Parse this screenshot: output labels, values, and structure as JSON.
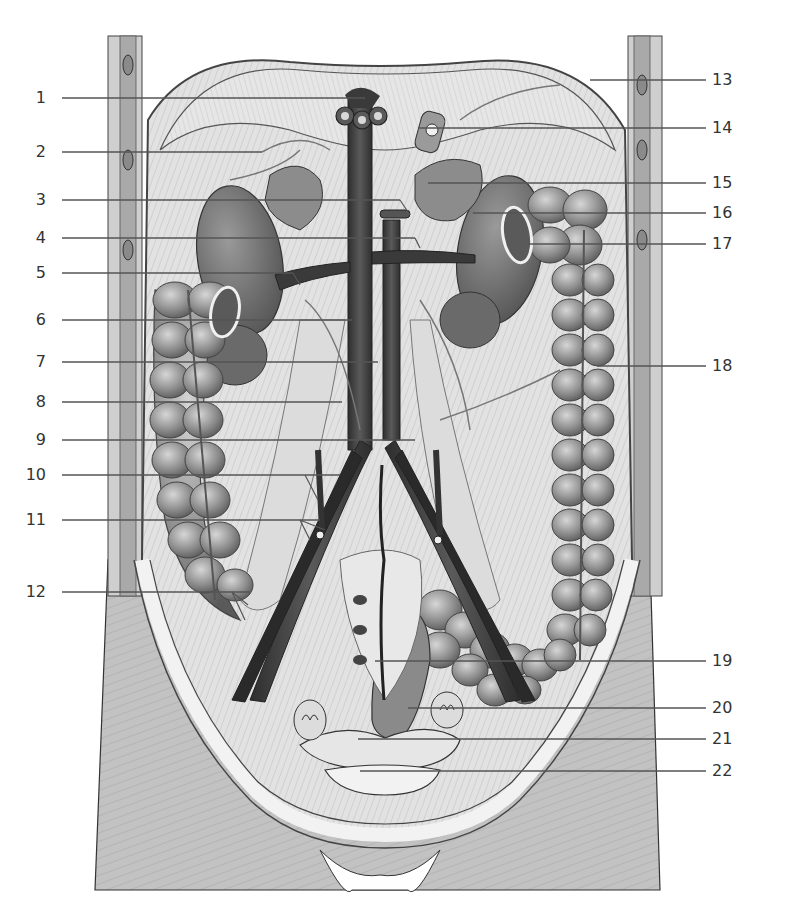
{
  "figure": {
    "type": "anatomical-illustration",
    "colors": {
      "background": "#ffffff",
      "label_text": "#333333",
      "leader_line": "#555555",
      "vessel_dark": "#3a3a3a",
      "organ_mid": "#7a7a7a",
      "muscle_light": "#d8d8d8",
      "skin": "#bdbdbd"
    }
  },
  "labels": {
    "left": [
      {
        "num": "1",
        "y": 98,
        "x_end": 365
      },
      {
        "num": "2",
        "y": 152,
        "x_end": 262
      },
      {
        "num": "3",
        "y": 200,
        "x_end": 400
      },
      {
        "num": "4",
        "y": 238,
        "x_end": 415
      },
      {
        "num": "5",
        "y": 273,
        "x_end": 293
      },
      {
        "num": "6",
        "y": 320,
        "x_end": 352
      },
      {
        "num": "7",
        "y": 362,
        "x_end": 378
      },
      {
        "num": "8",
        "y": 402,
        "x_end": 342
      },
      {
        "num": "9",
        "y": 440,
        "x_end": 415
      },
      {
        "num": "10",
        "y": 475,
        "x_end": 340
      },
      {
        "num": "11",
        "y": 520,
        "x_end": 320
      },
      {
        "num": "12",
        "y": 592,
        "x_end": 250
      }
    ],
    "right": [
      {
        "num": "13",
        "y": 80,
        "x_start": 590
      },
      {
        "num": "14",
        "y": 128,
        "x_start": 418
      },
      {
        "num": "15",
        "y": 183,
        "x_start": 428
      },
      {
        "num": "16",
        "y": 213,
        "x_start": 473
      },
      {
        "num": "17",
        "y": 244,
        "x_start": 528
      },
      {
        "num": "18",
        "y": 366,
        "x_start": 597
      },
      {
        "num": "19",
        "y": 661,
        "x_start": 375
      },
      {
        "num": "20",
        "y": 708,
        "x_start": 408
      },
      {
        "num": "21",
        "y": 739,
        "x_start": 358
      },
      {
        "num": "22",
        "y": 771,
        "x_start": 360
      }
    ]
  }
}
